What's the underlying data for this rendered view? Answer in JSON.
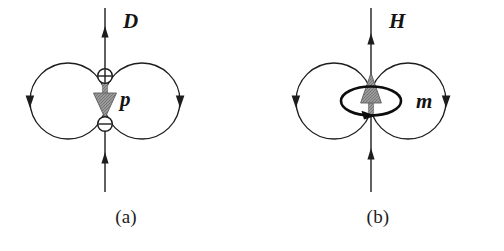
{
  "figure": {
    "background_color": "#ffffff",
    "line_color": "#1d1d1d",
    "moment_arrow_color": "#8c8c8c"
  },
  "panels": [
    {
      "id": "a",
      "caption": "(a)",
      "field_label": "D",
      "moment_label": "p",
      "source_top_symbol": "⊕",
      "source_bottom_symbol": "⊖",
      "moment_direction": "down",
      "axis_arrow_direction": "up",
      "lobe_arrow_direction": "down",
      "dipole_type": "electric"
    },
    {
      "id": "b",
      "caption": "(b)",
      "field_label": "H",
      "moment_label": "m",
      "source_symbol": "current-loop",
      "moment_direction": "up",
      "axis_arrow_direction": "up",
      "lobe_arrow_direction": "down",
      "loop_circulation": "clockwise-viewed-from-above",
      "dipole_type": "magnetic"
    }
  ]
}
